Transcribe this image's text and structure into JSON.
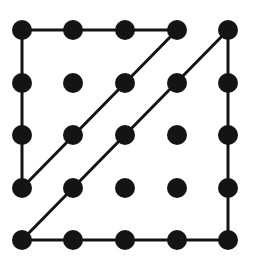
{
  "figure": {
    "canvas": {
      "width": 253,
      "height": 271
    },
    "background_color": "#ffffff",
    "ink_color": "#141414"
  },
  "chart_data": {
    "type": "scatter",
    "xlabel": "",
    "ylabel": "",
    "grid": false,
    "legend_position": "none",
    "rows": 5,
    "columns": 5,
    "x": [
      22,
      73,
      125,
      177,
      228
    ],
    "y": [
      30,
      83,
      135,
      188,
      240
    ],
    "x_spacing": 51.5,
    "y_spacing": 52.5,
    "dot_radius": 10,
    "dot_color": "#141414",
    "line_width": 3,
    "line_color": "#141414",
    "point_count": 25,
    "points": [
      {
        "id": "r1c1",
        "row": 1,
        "col": 1,
        "x": 22,
        "y": 30
      },
      {
        "id": "r1c2",
        "row": 1,
        "col": 2,
        "x": 73,
        "y": 30
      },
      {
        "id": "r1c3",
        "row": 1,
        "col": 3,
        "x": 125,
        "y": 30
      },
      {
        "id": "r1c4",
        "row": 1,
        "col": 4,
        "x": 177,
        "y": 30
      },
      {
        "id": "r1c5",
        "row": 1,
        "col": 5,
        "x": 228,
        "y": 30
      },
      {
        "id": "r2c1",
        "row": 2,
        "col": 1,
        "x": 22,
        "y": 83
      },
      {
        "id": "r2c2",
        "row": 2,
        "col": 2,
        "x": 73,
        "y": 83
      },
      {
        "id": "r2c3",
        "row": 2,
        "col": 3,
        "x": 125,
        "y": 83
      },
      {
        "id": "r2c4",
        "row": 2,
        "col": 4,
        "x": 177,
        "y": 83
      },
      {
        "id": "r2c5",
        "row": 2,
        "col": 5,
        "x": 228,
        "y": 83
      },
      {
        "id": "r3c1",
        "row": 3,
        "col": 1,
        "x": 22,
        "y": 135
      },
      {
        "id": "r3c2",
        "row": 3,
        "col": 2,
        "x": 73,
        "y": 135
      },
      {
        "id": "r3c3",
        "row": 3,
        "col": 3,
        "x": 125,
        "y": 135
      },
      {
        "id": "r3c4",
        "row": 3,
        "col": 4,
        "x": 177,
        "y": 135
      },
      {
        "id": "r3c5",
        "row": 3,
        "col": 5,
        "x": 228,
        "y": 135
      },
      {
        "id": "r4c1",
        "row": 4,
        "col": 1,
        "x": 22,
        "y": 188
      },
      {
        "id": "r4c2",
        "row": 4,
        "col": 2,
        "x": 73,
        "y": 188
      },
      {
        "id": "r4c3",
        "row": 4,
        "col": 3,
        "x": 125,
        "y": 188
      },
      {
        "id": "r4c4",
        "row": 4,
        "col": 4,
        "x": 177,
        "y": 188
      },
      {
        "id": "r4c5",
        "row": 4,
        "col": 5,
        "x": 228,
        "y": 188
      },
      {
        "id": "r5c1",
        "row": 5,
        "col": 1,
        "x": 22,
        "y": 240
      },
      {
        "id": "r5c2",
        "row": 5,
        "col": 2,
        "x": 73,
        "y": 240
      },
      {
        "id": "r5c3",
        "row": 5,
        "col": 3,
        "x": 125,
        "y": 240
      },
      {
        "id": "r5c4",
        "row": 5,
        "col": 4,
        "x": 177,
        "y": 240
      },
      {
        "id": "r5c5",
        "row": 5,
        "col": 5,
        "x": 228,
        "y": 240
      }
    ],
    "segment_count": 6,
    "segments": [
      {
        "id": "top-edge",
        "label": "top edge",
        "from": "r1c1",
        "to": "r1c4",
        "x1": 22,
        "y1": 30,
        "x2": 177,
        "y2": 30,
        "orientation": "horizontal"
      },
      {
        "id": "left-edge",
        "label": "left edge",
        "from": "r1c1",
        "to": "r4c1",
        "x1": 22,
        "y1": 30,
        "x2": 22,
        "y2": 188,
        "orientation": "vertical"
      },
      {
        "id": "bottom-edge",
        "label": "bottom edge",
        "from": "r5c1",
        "to": "r5c5",
        "x1": 22,
        "y1": 240,
        "x2": 228,
        "y2": 240,
        "orientation": "horizontal"
      },
      {
        "id": "right-edge",
        "label": "right edge",
        "from": "r1c5",
        "to": "r5c5",
        "x1": 228,
        "y1": 30,
        "x2": 228,
        "y2": 240,
        "orientation": "vertical"
      },
      {
        "id": "diagonal-upper",
        "label": "upper diagonal",
        "from": "r4c1",
        "to": "r1c4",
        "x1": 22,
        "y1": 188,
        "x2": 177,
        "y2": 30,
        "orientation": "diagonal"
      },
      {
        "id": "diagonal-lower",
        "label": "lower diagonal",
        "from": "r5c1",
        "to": "r1c5",
        "x1": 22,
        "y1": 240,
        "x2": 228,
        "y2": 30,
        "orientation": "diagonal"
      }
    ]
  }
}
